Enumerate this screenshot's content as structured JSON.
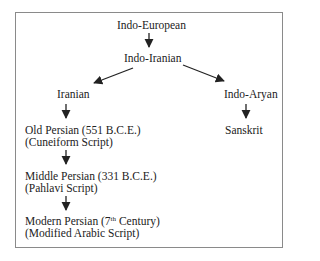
{
  "diagram": {
    "type": "tree",
    "title": "",
    "nodes": {
      "root": {
        "label": "Indo-European"
      },
      "indo_iranian": {
        "label": "Indo-Iranian"
      },
      "iranian": {
        "label": "Iranian"
      },
      "indo_aryan": {
        "label": "Indo-Aryan"
      },
      "sanskrit": {
        "label": "Sanskrit"
      },
      "old_persian": {
        "label": "Old Persian (551 B.C.E.)",
        "sublabel": "(Cuneiform Script)"
      },
      "middle_persian": {
        "label": "Middle Persian (331 B.C.E.)",
        "sublabel": "(Pahlavi Script)"
      },
      "modern_persian": {
        "label_prefix": "Modern Persian (7",
        "label_sup": "th",
        "label_suffix": " Century)",
        "sublabel": "(Modified Arabic Script)"
      }
    },
    "edges": [
      {
        "from": "Indo-European",
        "to": "Indo-Iranian"
      },
      {
        "from": "Indo-Iranian",
        "to": "Iranian"
      },
      {
        "from": "Indo-Iranian",
        "to": "Indo-Aryan"
      },
      {
        "from": "Iranian",
        "to": "Old Persian"
      },
      {
        "from": "Indo-Aryan",
        "to": "Sanskrit"
      },
      {
        "from": "Old Persian",
        "to": "Middle Persian"
      },
      {
        "from": "Middle Persian",
        "to": "Modern Persian"
      }
    ],
    "colors": {
      "border": "#8a8a8a",
      "arrow": "#222222",
      "text": "#222222"
    }
  }
}
